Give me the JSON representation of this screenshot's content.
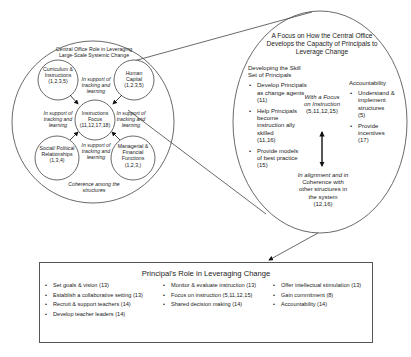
{
  "left_circle": {
    "title": "Central Office Role in Leveraging Large-Scale Systemic Change",
    "footer": "Coherence among the structures",
    "nodes": {
      "curriculum": {
        "label": "Curriculum & Instructions",
        "refs": "(1,2,3,5)"
      },
      "human_capital": {
        "label": "Human Capital",
        "refs": "(1,2,3,5)"
      },
      "instructional_focus": {
        "label": "Instructions Focus",
        "refs": "(11,12,17,18)"
      },
      "social_political": {
        "label": "Social/ Political Relationships",
        "refs": "(1,3,4)"
      },
      "managerial": {
        "label": "Managerial & Financial Functions",
        "refs": "(1,2,3,)"
      }
    },
    "support_label": "In support of tracking and learning"
  },
  "right_oval": {
    "title": "A Focus on How the Central Office Develops the Capacity of Principals to Leverage Change",
    "skill_set": {
      "heading": "Developing the Skill Set of Principals",
      "items": [
        {
          "text": "Develop Principals as change agents",
          "refs": "(11)"
        },
        {
          "text": "Help Principals become instruction ally skilled",
          "refs": "(11,16)"
        },
        {
          "text": "Provide models of best practice",
          "refs": "(15)"
        }
      ]
    },
    "focus_top": {
      "text": "With a Focus on Instruction",
      "refs": "(5,11,12,15)"
    },
    "focus_bottom": {
      "italic": "In alignment and in",
      "text": "Coherence with other structures in the system",
      "refs": "(12,16)"
    },
    "accountability": {
      "heading": "Accountability",
      "items": [
        {
          "text": "Understand & implement structures",
          "refs": "(5)"
        },
        {
          "text": "Provide incentives",
          "refs": "(17)"
        }
      ]
    }
  },
  "principal_box": {
    "title": "Principal's Role in Leveraging Change",
    "columns": [
      [
        "Set goals & vision (13)",
        "Establish a collaborative setting (13)",
        "Recruit & support teachers (14)",
        "Develop teacher leaders (14)"
      ],
      [
        "Monitor & evaluate instruction (13)",
        "Focus on instruction (5,11,12,15)",
        "Shared decision making (14)"
      ],
      [
        "Offer intellectual stimulation (13)",
        "Gain commitment (8)",
        "Accountability (14)"
      ]
    ]
  }
}
